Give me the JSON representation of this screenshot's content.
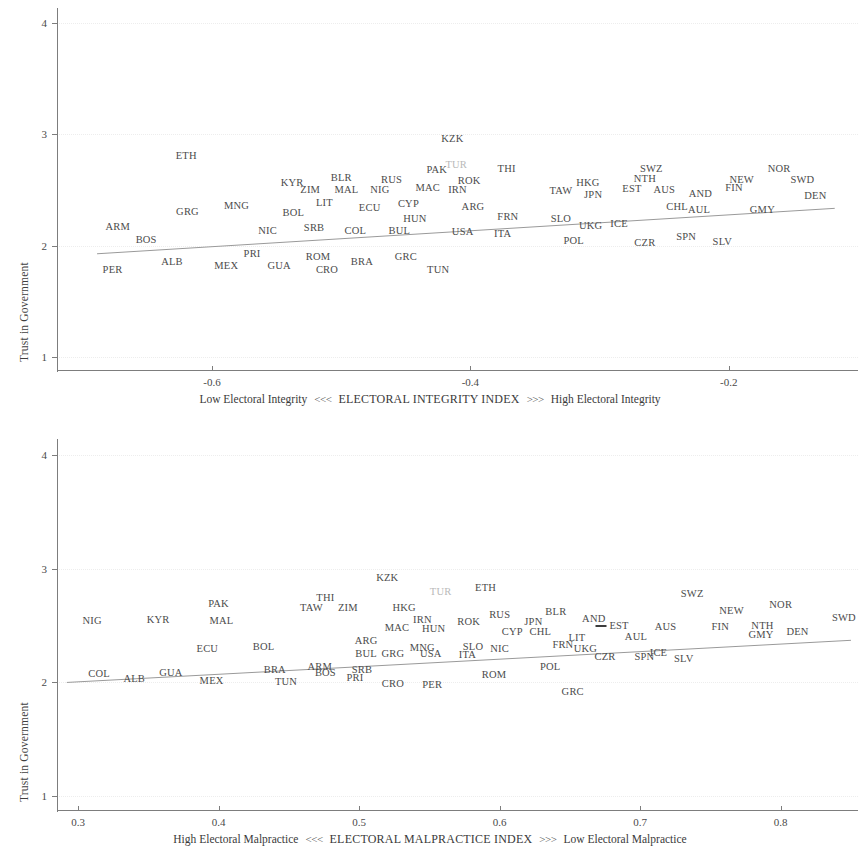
{
  "figure": {
    "background": "#ffffff",
    "text_color": "#4b4b4b",
    "faint_color": "#b9b9b9",
    "axis_color": "#7d7d7d",
    "fit_line_color": "#9a9a9a"
  },
  "chart_data": [
    {
      "id": "top",
      "type": "scatter",
      "title": "",
      "ylabel": "Trust in Government",
      "xlabel": "ELECTORAL INTEGRITY INDEX",
      "xlabel_left": "Low Electoral Integrity",
      "xlabel_right": "High Electoral Integrity",
      "xlabel_arrow_left": "<<<",
      "xlabel_arrow_right": ">>>",
      "xlim": [
        -0.72,
        -0.1
      ],
      "ylim": [
        0.88,
        4.12
      ],
      "xticks": [
        -0.6,
        -0.4,
        -0.2
      ],
      "xticklabels": [
        "-0.6",
        "-0.4",
        "-0.2"
      ],
      "yticks": [
        1,
        2,
        3,
        4
      ],
      "yticklabels": [
        "1",
        "2",
        "3",
        "4"
      ],
      "grid": true,
      "marker_style": "text-label",
      "fit_line": {
        "x0": -0.689,
        "y0": 1.926,
        "x1": -0.118,
        "y1": 2.335
      },
      "points": [
        {
          "label": "ETH",
          "x": -0.62,
          "y": 2.803,
          "faint": false
        },
        {
          "label": "KZK",
          "x": -0.414,
          "y": 2.96,
          "faint": false
        },
        {
          "label": "TUR",
          "x": -0.411,
          "y": 2.722,
          "faint": true
        },
        {
          "label": "PAK",
          "x": -0.426,
          "y": 2.679,
          "faint": false
        },
        {
          "label": "THI",
          "x": -0.372,
          "y": 2.685,
          "faint": false
        },
        {
          "label": "SWZ",
          "x": -0.26,
          "y": 2.69,
          "faint": false
        },
        {
          "label": "NOR",
          "x": -0.161,
          "y": 2.69,
          "faint": false
        },
        {
          "label": "KYR",
          "x": -0.538,
          "y": 2.565,
          "faint": false
        },
        {
          "label": "BLR",
          "x": -0.5,
          "y": 2.608,
          "faint": false
        },
        {
          "label": "RUS",
          "x": -0.461,
          "y": 2.588,
          "faint": false
        },
        {
          "label": "ROK",
          "x": -0.401,
          "y": 2.578,
          "faint": false
        },
        {
          "label": "NTH",
          "x": -0.265,
          "y": 2.595,
          "faint": false
        },
        {
          "label": "NEW",
          "x": -0.19,
          "y": 2.588,
          "faint": false
        },
        {
          "label": "SWD",
          "x": -0.143,
          "y": 2.588,
          "faint": false
        },
        {
          "label": "HKG",
          "x": -0.309,
          "y": 2.565,
          "faint": false
        },
        {
          "label": "ZIM",
          "x": -0.524,
          "y": 2.5,
          "faint": false
        },
        {
          "label": "MAL",
          "x": -0.496,
          "y": 2.497,
          "faint": false
        },
        {
          "label": "NIG",
          "x": -0.47,
          "y": 2.497,
          "faint": false
        },
        {
          "label": "MAC",
          "x": -0.433,
          "y": 2.52,
          "faint": false
        },
        {
          "label": "IRN",
          "x": -0.41,
          "y": 2.497,
          "faint": false
        },
        {
          "label": "TAW",
          "x": -0.33,
          "y": 2.49,
          "faint": false
        },
        {
          "label": "EST",
          "x": -0.275,
          "y": 2.51,
          "faint": false
        },
        {
          "label": "AUS",
          "x": -0.25,
          "y": 2.497,
          "faint": false
        },
        {
          "label": "AND",
          "x": -0.222,
          "y": 2.463,
          "faint": false
        },
        {
          "label": "FIN",
          "x": -0.196,
          "y": 2.52,
          "faint": false
        },
        {
          "label": "JPN",
          "x": -0.305,
          "y": 2.455,
          "faint": false
        },
        {
          "label": "MNG",
          "x": -0.581,
          "y": 2.355,
          "faint": false
        },
        {
          "label": "LIT",
          "x": -0.513,
          "y": 2.385,
          "faint": false
        },
        {
          "label": "CYP",
          "x": -0.448,
          "y": 2.378,
          "faint": false
        },
        {
          "label": "ECU",
          "x": -0.478,
          "y": 2.338,
          "faint": false
        },
        {
          "label": "ARG",
          "x": -0.398,
          "y": 2.345,
          "faint": false
        },
        {
          "label": "DEN",
          "x": -0.133,
          "y": 2.45,
          "faint": false
        },
        {
          "label": "CHL",
          "x": -0.24,
          "y": 2.345,
          "faint": false
        },
        {
          "label": "AUL",
          "x": -0.223,
          "y": 2.32,
          "faint": false
        },
        {
          "label": "GMY",
          "x": -0.174,
          "y": 2.32,
          "faint": false
        },
        {
          "label": "GRG",
          "x": -0.619,
          "y": 2.298,
          "faint": false
        },
        {
          "label": "BOL",
          "x": -0.537,
          "y": 2.29,
          "faint": false
        },
        {
          "label": "ARM",
          "x": -0.673,
          "y": 2.165,
          "faint": false
        },
        {
          "label": "HUN",
          "x": -0.443,
          "y": 2.235,
          "faint": false
        },
        {
          "label": "FRN",
          "x": -0.371,
          "y": 2.26,
          "faint": false
        },
        {
          "label": "SLO",
          "x": -0.33,
          "y": 2.235,
          "faint": false
        },
        {
          "label": "UKG",
          "x": -0.307,
          "y": 2.18,
          "faint": false
        },
        {
          "label": "ICE",
          "x": -0.285,
          "y": 2.195,
          "faint": false
        },
        {
          "label": "NIC",
          "x": -0.557,
          "y": 2.135,
          "faint": false
        },
        {
          "label": "SRB",
          "x": -0.521,
          "y": 2.16,
          "faint": false
        },
        {
          "label": "COL",
          "x": -0.489,
          "y": 2.135,
          "faint": false
        },
        {
          "label": "BUL",
          "x": -0.455,
          "y": 2.135,
          "faint": false
        },
        {
          "label": "USA",
          "x": -0.406,
          "y": 2.12,
          "faint": false
        },
        {
          "label": "ITA",
          "x": -0.375,
          "y": 2.1,
          "faint": false
        },
        {
          "label": "POL",
          "x": -0.32,
          "y": 2.04,
          "faint": false
        },
        {
          "label": "CZR",
          "x": -0.265,
          "y": 2.025,
          "faint": false
        },
        {
          "label": "SPN",
          "x": -0.233,
          "y": 2.08,
          "faint": false
        },
        {
          "label": "SLV",
          "x": -0.205,
          "y": 2.03,
          "faint": false
        },
        {
          "label": "BOS",
          "x": -0.651,
          "y": 2.05,
          "faint": false
        },
        {
          "label": "PRI",
          "x": -0.569,
          "y": 1.925,
          "faint": false
        },
        {
          "label": "ROM",
          "x": -0.518,
          "y": 1.9,
          "faint": false
        },
        {
          "label": "GRC",
          "x": -0.45,
          "y": 1.9,
          "faint": false
        },
        {
          "label": "BRA",
          "x": -0.484,
          "y": 1.855,
          "faint": false
        },
        {
          "label": "ALB",
          "x": -0.631,
          "y": 1.855,
          "faint": false
        },
        {
          "label": "MEX",
          "x": -0.589,
          "y": 1.815,
          "faint": false
        },
        {
          "label": "GUA",
          "x": -0.548,
          "y": 1.815,
          "faint": false
        },
        {
          "label": "CRO",
          "x": -0.511,
          "y": 1.78,
          "faint": false
        },
        {
          "label": "TUN",
          "x": -0.425,
          "y": 1.78,
          "faint": false
        },
        {
          "label": "PER",
          "x": -0.677,
          "y": 1.78,
          "faint": false
        }
      ]
    },
    {
      "id": "bottom",
      "type": "scatter",
      "title": "",
      "ylabel": "Trust in Government",
      "xlabel": "ELECTORAL MALPRACTICE INDEX",
      "xlabel_left": "High Electoral Malpractice",
      "xlabel_right": "Low Electoral Malpractice",
      "xlabel_arrow_left": "<<<",
      "xlabel_arrow_right": ">>>",
      "xlim": [
        0.285,
        0.855
      ],
      "ylim": [
        0.88,
        4.12
      ],
      "xticks": [
        0.3,
        0.4,
        0.5,
        0.6,
        0.7,
        0.8
      ],
      "xticklabels": [
        "0.3",
        "0.4",
        "0.5",
        "0.6",
        "0.7",
        "0.8"
      ],
      "yticks": [
        1,
        2,
        3,
        4
      ],
      "yticklabels": [
        "1",
        "2",
        "3",
        "4"
      ],
      "grid": true,
      "marker_style": "text-label",
      "fit_line": {
        "x0": 0.292,
        "y0": 2.0,
        "x1": 0.85,
        "y1": 2.37
      },
      "points": [
        {
          "label": "KZK",
          "x": 0.52,
          "y": 2.92,
          "faint": false
        },
        {
          "label": "TUR",
          "x": 0.558,
          "y": 2.79,
          "faint": true
        },
        {
          "label": "ETH",
          "x": 0.59,
          "y": 2.83,
          "faint": false
        },
        {
          "label": "THI",
          "x": 0.476,
          "y": 2.74,
          "faint": false
        },
        {
          "label": "PAK",
          "x": 0.4,
          "y": 2.69,
          "faint": false
        },
        {
          "label": "SWZ",
          "x": 0.737,
          "y": 2.775,
          "faint": false
        },
        {
          "label": "NOR",
          "x": 0.8,
          "y": 2.68,
          "faint": false
        },
        {
          "label": "TAW",
          "x": 0.466,
          "y": 2.65,
          "faint": false
        },
        {
          "label": "ZIM",
          "x": 0.492,
          "y": 2.655,
          "faint": false
        },
        {
          "label": "HKG",
          "x": 0.532,
          "y": 2.65,
          "faint": false
        },
        {
          "label": "NEW",
          "x": 0.765,
          "y": 2.63,
          "faint": false
        },
        {
          "label": "BLR",
          "x": 0.64,
          "y": 2.62,
          "faint": false
        },
        {
          "label": "RUS",
          "x": 0.6,
          "y": 2.59,
          "faint": false
        },
        {
          "label": "NIG",
          "x": 0.31,
          "y": 2.54,
          "faint": false
        },
        {
          "label": "KYR",
          "x": 0.357,
          "y": 2.545,
          "faint": false
        },
        {
          "label": "MAL",
          "x": 0.402,
          "y": 2.54,
          "faint": false
        },
        {
          "label": "IRN",
          "x": 0.545,
          "y": 2.545,
          "faint": false
        },
        {
          "label": "ROK",
          "x": 0.578,
          "y": 2.535,
          "faint": false
        },
        {
          "label": "SWD",
          "x": 0.845,
          "y": 2.565,
          "faint": false
        },
        {
          "label": "JPN",
          "x": 0.624,
          "y": 2.53,
          "faint": false
        },
        {
          "label": "AND",
          "x": 0.667,
          "y": 2.555,
          "faint": false
        },
        {
          "label": "EST",
          "x": 0.685,
          "y": 2.495,
          "faint": false
        },
        {
          "label": "NTH",
          "x": 0.787,
          "y": 2.495,
          "faint": false
        },
        {
          "label": "FIN",
          "x": 0.757,
          "y": 2.49,
          "faint": false
        },
        {
          "label": "AUS",
          "x": 0.718,
          "y": 2.49,
          "faint": false
        },
        {
          "label": "MAC",
          "x": 0.527,
          "y": 2.48,
          "faint": false
        },
        {
          "label": "HUN",
          "x": 0.553,
          "y": 2.47,
          "faint": false
        },
        {
          "label": "CYP",
          "x": 0.609,
          "y": 2.44,
          "faint": false
        },
        {
          "label": "CHL",
          "x": 0.629,
          "y": 2.44,
          "faint": false
        },
        {
          "label": "ARG",
          "x": 0.505,
          "y": 2.365,
          "faint": false
        },
        {
          "label": "ECU",
          "x": 0.392,
          "y": 2.29,
          "faint": false
        },
        {
          "label": "BOL",
          "x": 0.432,
          "y": 2.31,
          "faint": false
        },
        {
          "label": "MNG",
          "x": 0.545,
          "y": 2.3,
          "faint": false
        },
        {
          "label": "SLO",
          "x": 0.581,
          "y": 2.31,
          "faint": false
        },
        {
          "label": "NIC",
          "x": 0.6,
          "y": 2.29,
          "faint": false
        },
        {
          "label": "LIT",
          "x": 0.655,
          "y": 2.39,
          "faint": false
        },
        {
          "label": "GMY",
          "x": 0.786,
          "y": 2.415,
          "faint": false
        },
        {
          "label": "DEN",
          "x": 0.812,
          "y": 2.44,
          "faint": false
        },
        {
          "label": "AUL",
          "x": 0.697,
          "y": 2.395,
          "faint": false
        },
        {
          "label": "FRN",
          "x": 0.645,
          "y": 2.325,
          "faint": false
        },
        {
          "label": "UKG",
          "x": 0.661,
          "y": 2.29,
          "faint": false
        },
        {
          "label": "ICE",
          "x": 0.713,
          "y": 2.26,
          "faint": false
        },
        {
          "label": "GRG",
          "x": 0.524,
          "y": 2.25,
          "faint": false
        },
        {
          "label": "USA",
          "x": 0.551,
          "y": 2.25,
          "faint": false
        },
        {
          "label": "ITA",
          "x": 0.577,
          "y": 2.24,
          "faint": false
        },
        {
          "label": "BUL",
          "x": 0.505,
          "y": 2.25,
          "faint": false
        },
        {
          "label": "CZR",
          "x": 0.675,
          "y": 2.22,
          "faint": false
        },
        {
          "label": "SPN",
          "x": 0.703,
          "y": 2.225,
          "faint": false
        },
        {
          "label": "SLV",
          "x": 0.731,
          "y": 2.21,
          "faint": false
        },
        {
          "label": "COL",
          "x": 0.315,
          "y": 2.075,
          "faint": false
        },
        {
          "label": "ARM",
          "x": 0.472,
          "y": 2.135,
          "faint": false
        },
        {
          "label": "SRB",
          "x": 0.502,
          "y": 2.105,
          "faint": false
        },
        {
          "label": "POL",
          "x": 0.636,
          "y": 2.135,
          "faint": false
        },
        {
          "label": "BRA",
          "x": 0.44,
          "y": 2.11,
          "faint": false
        },
        {
          "label": "GUA",
          "x": 0.366,
          "y": 2.08,
          "faint": false
        },
        {
          "label": "BOS",
          "x": 0.476,
          "y": 2.08,
          "faint": false
        },
        {
          "label": "ROM",
          "x": 0.596,
          "y": 2.065,
          "faint": false
        },
        {
          "label": "ALB",
          "x": 0.34,
          "y": 2.03,
          "faint": false
        },
        {
          "label": "MEX",
          "x": 0.395,
          "y": 2.015,
          "faint": false
        },
        {
          "label": "PRI",
          "x": 0.497,
          "y": 2.035,
          "faint": false
        },
        {
          "label": "TUN",
          "x": 0.448,
          "y": 2.0,
          "faint": false
        },
        {
          "label": "CRO",
          "x": 0.524,
          "y": 1.985,
          "faint": false
        },
        {
          "label": "PER",
          "x": 0.552,
          "y": 1.975,
          "faint": false
        },
        {
          "label": "GRC",
          "x": 0.652,
          "y": 1.915,
          "faint": false
        }
      ]
    }
  ]
}
